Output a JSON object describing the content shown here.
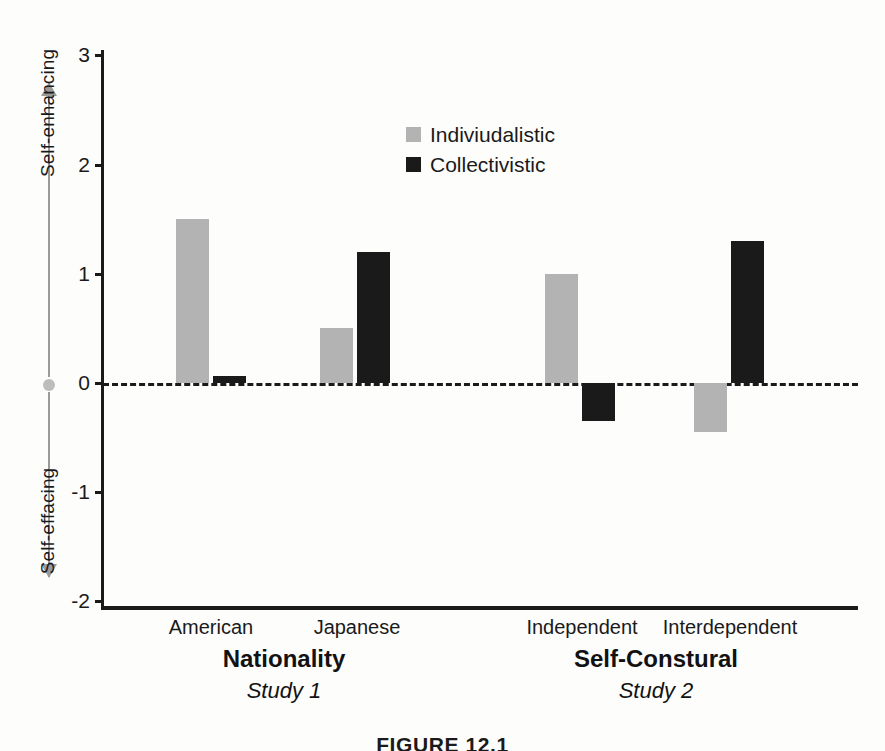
{
  "figure": {
    "caption": "FIGURE 12.1"
  },
  "axis": {
    "vertical_top_label": "Self-enhancing",
    "vertical_bottom_label": "Self-effacing",
    "tick_labels": [
      "3",
      "2",
      "1",
      "0",
      "-1",
      "-2"
    ]
  },
  "legend": {
    "position": "inside-top-center",
    "items": [
      {
        "label": "Indiviudalistic",
        "color": "#b3b3b3"
      },
      {
        "label": "Collectivistic",
        "color": "#1a1a1a"
      }
    ]
  },
  "groups": [
    {
      "title": "Nationality",
      "subtitle": "Study 1"
    },
    {
      "title": "Self-Constural",
      "subtitle": "Study 2"
    }
  ],
  "chart_data": {
    "type": "bar",
    "title": "",
    "xlabel": "",
    "ylabel": "Self-enhancing / Self-effacing",
    "ylim": [
      -2,
      3
    ],
    "yticks": [
      3,
      2,
      1,
      0,
      -1,
      -2
    ],
    "grid": false,
    "zero_line": true,
    "categories": [
      "American",
      "Japanese",
      "Independent",
      "Interdependent"
    ],
    "group_of_category": [
      "Nationality",
      "Nationality",
      "Self-Constural",
      "Self-Constural"
    ],
    "series": [
      {
        "name": "Indiviudalistic",
        "color": "#b3b3b3",
        "values": [
          1.5,
          0.5,
          1.0,
          -0.45
        ]
      },
      {
        "name": "Collectivistic",
        "color": "#1a1a1a",
        "values": [
          0.06,
          1.2,
          -0.35,
          1.3
        ]
      }
    ]
  },
  "geometry": {
    "zero_y": 383,
    "unit_px": 109.2,
    "bar_width": 33,
    "bar_x": {
      "american": [
        176,
        213
      ],
      "japanese": [
        320,
        357
      ],
      "independent": [
        545,
        582
      ],
      "interdependent": [
        694,
        731
      ]
    },
    "category_center_x": [
      211,
      357,
      582,
      730
    ],
    "group_center_x": [
      284,
      656
    ]
  }
}
